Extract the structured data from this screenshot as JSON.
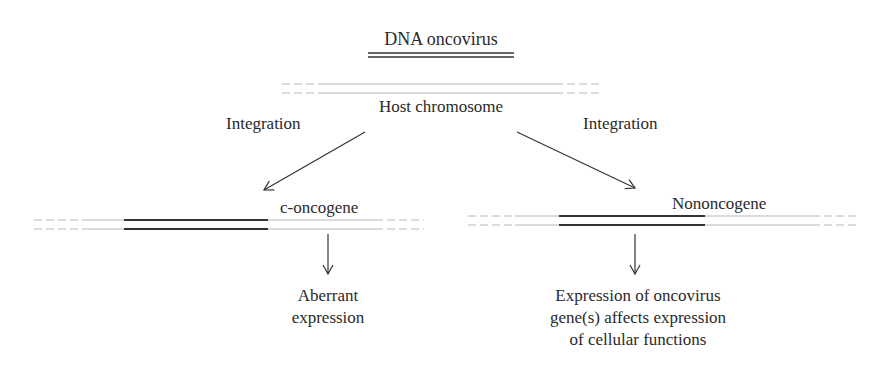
{
  "title": "DNA oncovirus",
  "host_label": "Host chromosome",
  "left_branch": {
    "arrow_label": "Integration",
    "gene_label": "c-oncogene",
    "outcome": [
      "Aberrant",
      "expression"
    ]
  },
  "right_branch": {
    "arrow_label": "Integration",
    "gene_label": "Nononcogene",
    "outcome": [
      "Expression of oncovirus",
      "gene(s) affects expression",
      "of cellular functions"
    ]
  },
  "colors": {
    "text": "#2a2a2a",
    "dna_strand": "#b0b0b0",
    "gene_segment": "#333333"
  }
}
